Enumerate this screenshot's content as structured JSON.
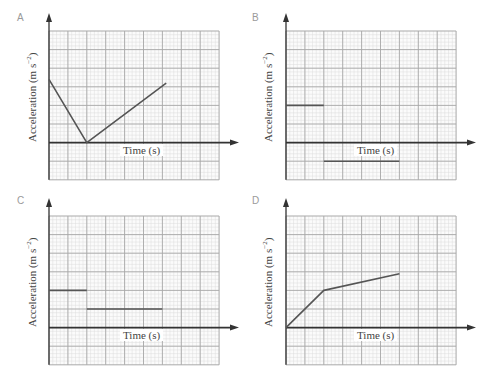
{
  "chart_data": [
    {
      "id": "A",
      "type": "line",
      "title": "A",
      "xlabel": "Time (s)",
      "ylabel": "Acceleration (m s⁻²)",
      "grid": true,
      "xlim": [
        0,
        9
      ],
      "ylim": [
        -2,
        6
      ],
      "series": [
        {
          "name": "A",
          "x": [
            0,
            2,
            6.2
          ],
          "y": [
            3.4,
            0,
            3.2
          ]
        }
      ]
    },
    {
      "id": "B",
      "type": "line",
      "title": "B",
      "xlabel": "Time (s)",
      "ylabel": "Acceleration (m s⁻²)",
      "grid": true,
      "xlim": [
        0,
        9
      ],
      "ylim": [
        -2,
        6
      ],
      "series": [
        {
          "name": "B segment 1",
          "x": [
            0,
            2
          ],
          "y": [
            2,
            2
          ]
        },
        {
          "name": "B segment 2",
          "x": [
            2,
            6
          ],
          "y": [
            -1,
            -1
          ]
        }
      ]
    },
    {
      "id": "C",
      "type": "line",
      "title": "C",
      "xlabel": "Time (s)",
      "ylabel": "Acceleration (m s⁻²)",
      "grid": true,
      "xlim": [
        0,
        9
      ],
      "ylim": [
        -2,
        6
      ],
      "series": [
        {
          "name": "C segment 1",
          "x": [
            0,
            2
          ],
          "y": [
            2,
            2
          ]
        },
        {
          "name": "C segment 2",
          "x": [
            2,
            6
          ],
          "y": [
            1,
            1
          ]
        }
      ]
    },
    {
      "id": "D",
      "type": "line",
      "title": "D",
      "xlabel": "Time (s)",
      "ylabel": "Acceleration (m s⁻²)",
      "grid": true,
      "xlim": [
        0,
        9
      ],
      "ylim": [
        -2,
        6
      ],
      "series": [
        {
          "name": "D",
          "x": [
            0,
            2,
            6
          ],
          "y": [
            0,
            2,
            2.9
          ]
        }
      ]
    }
  ],
  "panels": [
    {
      "letter": "A",
      "xlabel": "Time (s)",
      "ylabel_main": "Acceleration (m s",
      "ylabel_sup": "−2",
      "ylabel_end": ")"
    },
    {
      "letter": "B",
      "xlabel": "Time (s)",
      "ylabel_main": "Acceleration (m s",
      "ylabel_sup": "−2",
      "ylabel_end": ")"
    },
    {
      "letter": "C",
      "xlabel": "Time (s)",
      "ylabel_main": "Acceleration (m s",
      "ylabel_sup": "−2",
      "ylabel_end": ")"
    },
    {
      "letter": "D",
      "xlabel": "Time (s)",
      "ylabel_main": "Acceleration (m s",
      "ylabel_sup": "−2",
      "ylabel_end": ")"
    }
  ],
  "colors": {
    "grid_major": "#a8a8a8",
    "grid_minor": "#dcdcdc",
    "axis": "#333333",
    "line": "#555555",
    "letter": "#9a9a9a"
  }
}
